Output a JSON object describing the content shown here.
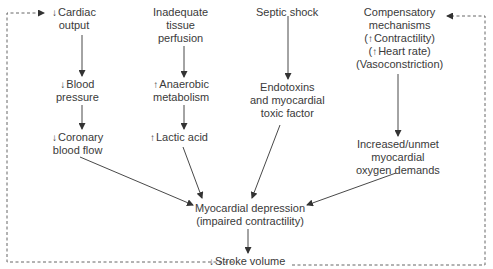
{
  "diagram": {
    "type": "flowchart",
    "nodes": {
      "cardiac_output": {
        "arrow": "↓",
        "lines": [
          "Cardiac",
          "output"
        ]
      },
      "blood_pressure": {
        "arrow": "↓",
        "lines": [
          "Blood",
          "pressure"
        ]
      },
      "coronary_blood_flow": {
        "arrow": "↓",
        "lines": [
          "Coronary",
          "blood flow"
        ]
      },
      "inadequate_perfusion": {
        "lines": [
          "Inadequate",
          "tissue",
          "perfusion"
        ]
      },
      "anaerobic_metabolism": {
        "arrow": "↑",
        "lines": [
          "Anaerobic",
          "metabolism"
        ]
      },
      "lactic_acid": {
        "arrow": "↑",
        "lines": [
          "Lactic acid"
        ]
      },
      "septic_shock": {
        "lines": [
          "Septic shock"
        ]
      },
      "endotoxins": {
        "lines": [
          "Endotoxins",
          "and myocardial",
          "toxic factor"
        ]
      },
      "compensatory": {
        "lines": [
          "Compensatory",
          "mechanisms",
          "(",
          "Contractility)",
          "(",
          "Heart rate)",
          "(Vasoconstriction)"
        ],
        "arrow": "↑"
      },
      "oxygen_demands": {
        "lines": [
          "Increased/unmet",
          "myocardial",
          "oxygen demands"
        ]
      },
      "myocardial_depression": {
        "lines": [
          "Myocardial depression",
          "(impaired contractility)"
        ]
      },
      "stroke_volume": {
        "arrow": "↓",
        "lines": [
          "Stroke volume"
        ]
      }
    },
    "edges": [
      {
        "from": "cardiac_output",
        "to": "blood_pressure",
        "style": "solid"
      },
      {
        "from": "blood_pressure",
        "to": "coronary_blood_flow",
        "style": "solid"
      },
      {
        "from": "inadequate_perfusion",
        "to": "anaerobic_metabolism",
        "style": "solid"
      },
      {
        "from": "anaerobic_metabolism",
        "to": "lactic_acid",
        "style": "solid"
      },
      {
        "from": "septic_shock",
        "to": "endotoxins",
        "style": "solid"
      },
      {
        "from": "compensatory",
        "to": "oxygen_demands",
        "style": "solid"
      },
      {
        "from": "coronary_blood_flow",
        "to": "myocardial_depression",
        "style": "solid"
      },
      {
        "from": "lactic_acid",
        "to": "myocardial_depression",
        "style": "solid"
      },
      {
        "from": "endotoxins",
        "to": "myocardial_depression",
        "style": "solid"
      },
      {
        "from": "oxygen_demands",
        "to": "myocardial_depression",
        "style": "solid"
      },
      {
        "from": "myocardial_depression",
        "to": "stroke_volume",
        "style": "solid"
      },
      {
        "from": "stroke_volume",
        "to": "cardiac_output",
        "style": "dashed"
      },
      {
        "from": "stroke_volume",
        "to": "compensatory",
        "style": "dashed"
      }
    ]
  }
}
